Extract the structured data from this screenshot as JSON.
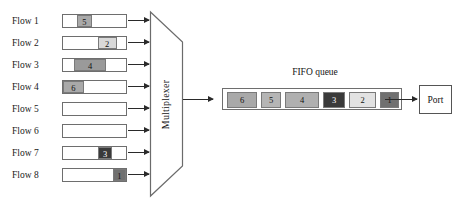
{
  "diagram": {
    "flows": [
      {
        "label": "Flow 1",
        "packet": {
          "value": "5",
          "offset_pct": 22,
          "width_pct": 24,
          "shade": "#a9a9a9"
        }
      },
      {
        "label": "Flow 2",
        "packet": {
          "value": "2",
          "offset_pct": 55,
          "width_pct": 30,
          "shade": "#d9d9d9"
        }
      },
      {
        "label": "Flow 3",
        "packet": {
          "value": "4",
          "offset_pct": 18,
          "width_pct": 50,
          "shade": "#9a9a9a"
        }
      },
      {
        "label": "Flow 4",
        "packet": {
          "value": "6",
          "offset_pct": 0,
          "width_pct": 33,
          "shade": "#a9a9a9"
        }
      },
      {
        "label": "Flow 5",
        "packet": null
      },
      {
        "label": "Flow 6",
        "packet": null
      },
      {
        "label": "Flow 7",
        "packet": {
          "value": "3",
          "offset_pct": 56,
          "width_pct": 22,
          "shade": "#3a3a3a"
        }
      },
      {
        "label": "Flow 8",
        "packet": {
          "value": "1",
          "offset_pct": 79,
          "width_pct": 21,
          "shade": "#707070"
        }
      }
    ],
    "multiplexer": {
      "label": "Multiplexer",
      "shape": "trapezoid"
    },
    "fifo": {
      "title": "FIFO queue",
      "cells": [
        {
          "value": "6",
          "width": 30,
          "shade": "#a9a9a9"
        },
        {
          "value": "5",
          "width": 20,
          "shade": "#b5b5b5"
        },
        {
          "value": "4",
          "width": 34,
          "shade": "#b0b0b0"
        },
        {
          "value": "3",
          "width": 22,
          "shade": "#3a3a3a"
        },
        {
          "value": "2",
          "width": 27,
          "shade": "#e2e2e2"
        },
        {
          "value": "1",
          "width": 19,
          "shade": "#707070"
        }
      ]
    },
    "port": {
      "label": "Port"
    },
    "colors": {
      "line": "#2a2a2a",
      "border": "#6e6e6e",
      "text": "#141414",
      "background": "#ffffff"
    }
  }
}
